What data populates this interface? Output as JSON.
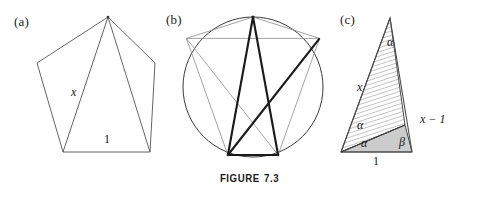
{
  "figure": {
    "caption_word": "FIGURE",
    "caption_number": "7.3",
    "line_color": "#555555",
    "bold_line_color": "#1a1a1a",
    "shade_fill": "#cfcfcf",
    "hatch_color": "#6e6e6e"
  },
  "panels": [
    {
      "key": "a",
      "label": "(a)",
      "name": "regular-pentagon-with-diagonals",
      "labels": [
        {
          "text": "x",
          "name": "side-label-x",
          "italic": true
        },
        {
          "text": "1",
          "name": "base-label-one",
          "italic": false
        }
      ]
    },
    {
      "key": "b",
      "label": "(b)",
      "name": "circumscribed-pentagon-pentagram",
      "labels": []
    },
    {
      "key": "c",
      "label": "(c)",
      "name": "similar-triangles-golden-ratio",
      "labels": [
        {
          "text": "α",
          "name": "angle-alpha-apex",
          "italic": true
        },
        {
          "text": "x",
          "name": "side-label-x",
          "italic": true
        },
        {
          "text": "α",
          "name": "angle-alpha-upper-inner",
          "italic": true
        },
        {
          "text": "α",
          "name": "angle-alpha-base-left",
          "italic": true
        },
        {
          "text": "1",
          "name": "base-label-one",
          "italic": false
        },
        {
          "text": "β",
          "name": "angle-beta-base-right",
          "italic": true
        },
        {
          "text": "x − 1",
          "name": "side-label-x-minus-one",
          "italic": true
        }
      ]
    }
  ]
}
